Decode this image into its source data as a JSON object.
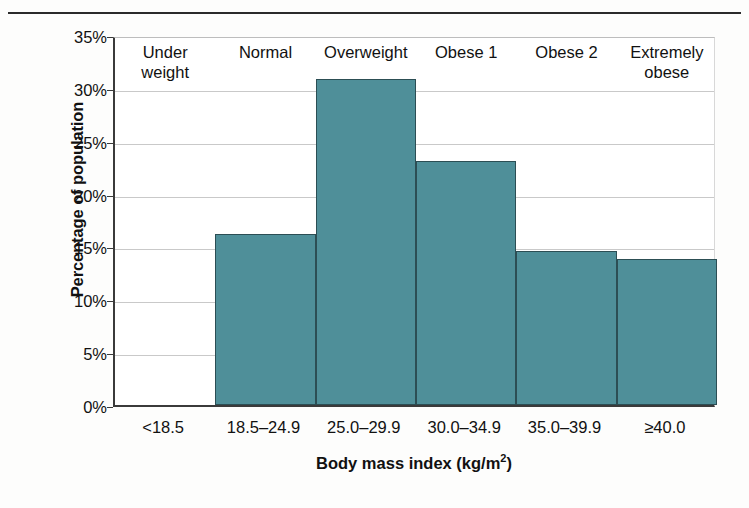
{
  "chart_data": {
    "type": "bar",
    "title": "",
    "xlabel": "Body mass index (kg/m2)",
    "xlabel_base": "Body mass index (kg/m",
    "xlabel_sup": "2",
    "xlabel_tail": ")",
    "ylabel": "Percentage of population",
    "categories": [
      "<18.5",
      "18.5–24.9",
      "25.0–29.9",
      "30.0–34.9",
      "35.0–39.9",
      "≥40.0"
    ],
    "category_names": [
      "Under\nweight",
      "Normal",
      "Overweight",
      "Obese 1",
      "Obese 2",
      "Extremely\nobese"
    ],
    "values": [
      0,
      16.2,
      30.8,
      23.1,
      14.6,
      13.8
    ],
    "value_labels": [
      "",
      "16.2%",
      "30.8%",
      "23.1%",
      "14.6%",
      "13.8%"
    ],
    "ylim": [
      0,
      35
    ],
    "ytick_values": [
      0,
      5,
      10,
      15,
      20,
      25,
      30,
      35
    ],
    "ytick_labels": [
      "0%",
      "5%",
      "10%",
      "15%",
      "20%",
      "25%",
      "30%",
      "35%"
    ],
    "grid": true,
    "legend": "none",
    "bar_color": "#4f8f99",
    "bar_edge_color": "#2c4e54",
    "axis_color": "#3a3a3a",
    "gridline_color": "#c9c9c9",
    "background": "#ffffff"
  }
}
